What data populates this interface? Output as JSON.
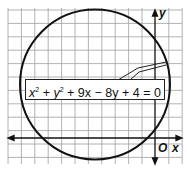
{
  "figure": {
    "equation": {
      "x_term": "x",
      "y_term": "y",
      "exp": "2",
      "rest": " + 9x − 8y + 4 = 0",
      "plus": " + "
    },
    "axes": {
      "x_label": "x",
      "y_label": "y",
      "origin_label": "O"
    },
    "circle": {
      "center": [
        -4.5,
        4
      ],
      "radius": 5.68
    },
    "grid": {
      "unit_px": 13.4,
      "color": "#9a9a9a"
    }
  }
}
